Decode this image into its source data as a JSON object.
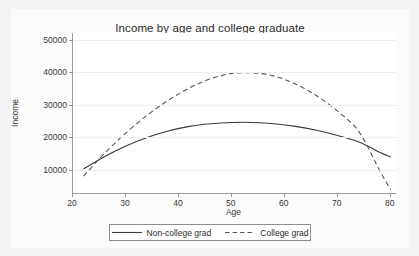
{
  "chart_data": {
    "type": "line",
    "title": "Income by age and college graduate",
    "xlabel": "Age",
    "ylabel": "Income",
    "grid": "horizontal",
    "legend_position": "bottom",
    "xlim": [
      20,
      81
    ],
    "ylim": [
      3000,
      52000
    ],
    "xticks": [
      20,
      30,
      40,
      50,
      60,
      70,
      80
    ],
    "yticks": [
      10000,
      20000,
      30000,
      40000,
      50000
    ],
    "xtick_labels": [
      "20",
      "30",
      "40",
      "50",
      "60",
      "70",
      "80"
    ],
    "ytick_labels": [
      "10000",
      "20000",
      "30000",
      "40000",
      "50000"
    ],
    "x": [
      22,
      26,
      30,
      34,
      38,
      42,
      46,
      50,
      54,
      58,
      62,
      66,
      70,
      74,
      78,
      80
    ],
    "series": [
      {
        "name": "Non-college grad",
        "style": "solid",
        "color": "#3a3a3a",
        "values": [
          10400,
          14200,
          17400,
          20000,
          22000,
          23400,
          24200,
          24600,
          24600,
          24200,
          23400,
          22200,
          20600,
          18600,
          15400,
          14000
        ]
      },
      {
        "name": "College grad",
        "style": "dashed",
        "color": "#555555",
        "values": [
          8200,
          15200,
          21400,
          26800,
          31400,
          35200,
          38000,
          39600,
          39800,
          38800,
          36400,
          32800,
          28000,
          21800,
          9600,
          4000
        ]
      }
    ]
  },
  "title": {
    "text": "Income by age and college graduate"
  },
  "yaxis": {
    "label": "Income",
    "ticks": [
      {
        "label": "50000",
        "value": 50000
      },
      {
        "label": "40000",
        "value": 40000
      },
      {
        "label": "30000",
        "value": 30000
      },
      {
        "label": "20000",
        "value": 20000
      },
      {
        "label": "10000",
        "value": 10000
      }
    ]
  },
  "xaxis": {
    "label": "Age",
    "ticks": [
      {
        "label": "20",
        "value": 20
      },
      {
        "label": "30",
        "value": 30
      },
      {
        "label": "40",
        "value": 40
      },
      {
        "label": "50",
        "value": 50
      },
      {
        "label": "60",
        "value": 60
      },
      {
        "label": "70",
        "value": 70
      },
      {
        "label": "80",
        "value": 80
      }
    ]
  },
  "legend": {
    "entries": [
      {
        "label": "Non-college grad",
        "style": "solid"
      },
      {
        "label": "College grad",
        "style": "dashed"
      }
    ]
  }
}
